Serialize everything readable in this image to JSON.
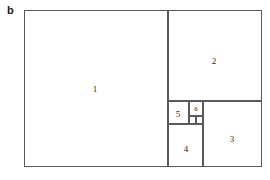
{
  "figure": {
    "panel_label": "b",
    "caption": "",
    "line_color": "#5a5a5a",
    "background_color": "#ffffff",
    "text_color": "#2b2b2b"
  },
  "diagram": {
    "type": "fibonacci-square-subdivision",
    "outer_rect": {
      "x": 24,
      "y": 10,
      "width": 238,
      "height": 157
    },
    "squares": [
      {
        "id": "square-1",
        "label": "1",
        "x": 24,
        "y": 10,
        "width": 144,
        "height": 157,
        "label_x": 95,
        "label_y": 89
      },
      {
        "id": "square-2",
        "label": "2",
        "x": 168,
        "y": 10,
        "width": 94,
        "height": 91,
        "label_x": 214,
        "label_y": 61
      },
      {
        "id": "square-3",
        "label": "3",
        "x": 203,
        "y": 101,
        "width": 59,
        "height": 66,
        "label_x": 232,
        "label_y": 139
      },
      {
        "id": "square-4",
        "label": "4",
        "x": 168,
        "y": 124,
        "width": 35,
        "height": 43,
        "label_x": 186,
        "label_y": 149
      },
      {
        "id": "square-5",
        "label": "5",
        "x": 168,
        "y": 101,
        "width": 21,
        "height": 23,
        "label_x": 178,
        "label_y": 114
      },
      {
        "id": "square-6",
        "label": "6",
        "x": 189,
        "y": 101,
        "width": 14,
        "height": 15,
        "label_x": 196,
        "label_y": 109
      },
      {
        "id": "square-7",
        "label": "",
        "x": 189,
        "y": 116,
        "width": 7,
        "height": 8,
        "label_x": 192,
        "label_y": 120
      },
      {
        "id": "square-8",
        "label": "",
        "x": 196,
        "y": 116,
        "width": 7,
        "height": 8,
        "label_x": 199,
        "label_y": 120
      }
    ]
  }
}
